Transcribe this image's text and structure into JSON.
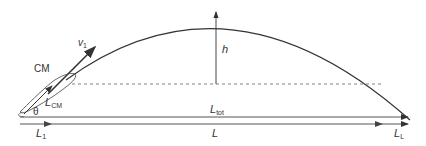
{
  "diagram": {
    "type": "long-jump trajectory",
    "labels": {
      "v1": "v",
      "v1_sub": "1",
      "h": "h",
      "cm": "CM",
      "lcm": "L",
      "lcm_sub": "CM",
      "theta": "θ",
      "ltot": "L",
      "ltot_sub": "tot",
      "l1": "L",
      "l1_sub": "1",
      "l": "L",
      "ll": "L",
      "ll_sub": "L"
    },
    "colors": {
      "line": "#333333",
      "dashed": "#666666",
      "light": "#999999"
    }
  }
}
